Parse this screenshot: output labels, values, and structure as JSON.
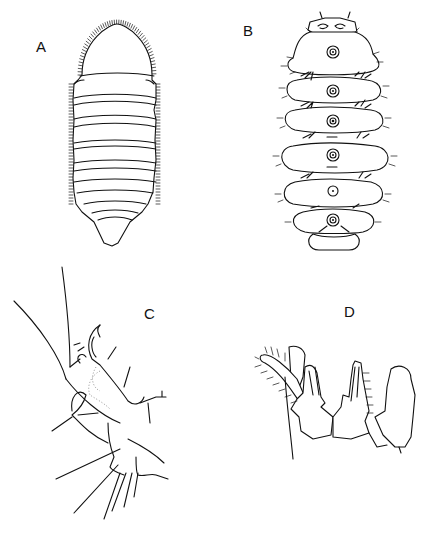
{
  "figure": {
    "panels": [
      {
        "id": "A",
        "label": "A",
        "description": "dorsal view of segmented oval body with fringed margins"
      },
      {
        "id": "B",
        "label": "B",
        "description": "ventral view with six lobed segments, central rings and appendages"
      },
      {
        "id": "C",
        "label": "C",
        "description": "appendage with claw and long setae"
      },
      {
        "id": "D",
        "label": "D",
        "description": "mouthparts / genital structures with setose lobes"
      }
    ]
  },
  "colors": {
    "ink": "#111111",
    "background": "#ffffff"
  }
}
